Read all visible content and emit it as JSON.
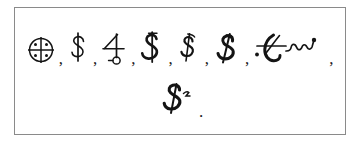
{
  "document": {
    "kind": "scanned-symbol-plate",
    "background_color": "#ffffff",
    "ink_color": "#141414",
    "border_color": "#8a8a8a"
  },
  "lines": [
    {
      "id": "line-1",
      "items": [
        {
          "name": "quartered-circle-with-dots-symbol",
          "glyph": "quartered-circle-dots",
          "separator": ","
        },
        {
          "name": "dollar-sign-symbol-1",
          "glyph": "dollar-upright",
          "separator": ","
        },
        {
          "name": "jupiter-four-loop-symbol",
          "glyph": "four-with-loop",
          "separator": ","
        },
        {
          "name": "dollar-sign-symbol-2",
          "glyph": "dollar-barred",
          "separator": ","
        },
        {
          "name": "dollar-sign-symbol-3",
          "glyph": "dollar-flagged",
          "separator": ","
        },
        {
          "name": "dollar-sign-symbol-4",
          "glyph": "dollar-bold-slanted",
          "separator": ","
        },
        {
          "name": "crossed-flourish-symbol",
          "glyph": "crossed-f-flourish",
          "separator": ","
        }
      ]
    },
    {
      "id": "line-2",
      "items": [
        {
          "name": "cursive-s-superscript-symbol",
          "glyph": "cursive-s-superscript",
          "separator": "."
        }
      ]
    }
  ],
  "separators": {
    "comma": ",",
    "period": "."
  }
}
